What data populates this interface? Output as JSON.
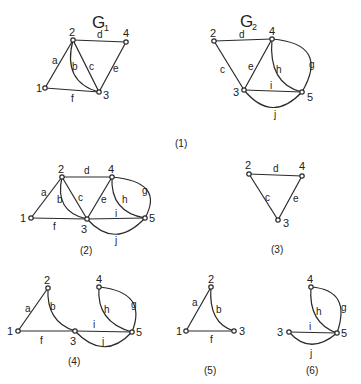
{
  "figure": {
    "caption_1": "(1)",
    "colors": {
      "ink": "#2a2a2a",
      "background": "#ffffff"
    },
    "graphs": {
      "G1": {
        "title": "G",
        "subscript": "1",
        "nodes": {
          "n1": "1",
          "n2": "2",
          "n3": "3",
          "n4": "4"
        },
        "edges": {
          "a": "a",
          "b": "b",
          "c": "c",
          "d": "d",
          "e": "e",
          "f": "f"
        }
      },
      "G2": {
        "title": "G",
        "subscript": "2",
        "nodes": {
          "n2": "2",
          "n3": "3",
          "n4": "4",
          "n5": "5"
        },
        "edges": {
          "c": "c",
          "d": "d",
          "e": "e",
          "g": "g",
          "h": "h",
          "i": "i",
          "j": "j"
        }
      },
      "P2": {
        "caption": "(2)",
        "nodes": {
          "n1": "1",
          "n2": "2",
          "n3": "3",
          "n4": "4",
          "n5": "5"
        },
        "edges": {
          "a": "a",
          "b": "b",
          "c": "c",
          "d": "d",
          "e": "e",
          "f": "f",
          "g": "g",
          "h": "h",
          "i": "i",
          "j": "j"
        }
      },
      "P3": {
        "caption": "(3)",
        "nodes": {
          "n2": "2",
          "n3": "3",
          "n4": "4"
        },
        "edges": {
          "c": "c",
          "d": "d",
          "e": "e"
        }
      },
      "P4": {
        "caption": "(4)",
        "nodes": {
          "n1": "1",
          "n2": "2",
          "n3": "3",
          "n4": "4",
          "n5": "5"
        },
        "edges": {
          "a": "a",
          "b": "b",
          "f": "f",
          "g": "g",
          "h": "h",
          "i": "i",
          "j": "j"
        }
      },
      "P5": {
        "caption": "(5)",
        "nodes": {
          "n1": "1",
          "n2": "2",
          "n3": "3"
        },
        "edges": {
          "a": "a",
          "b": "b",
          "f": "f"
        }
      },
      "P6": {
        "caption": "(6)",
        "nodes": {
          "n3": "3",
          "n4": "4",
          "n5": "5"
        },
        "edges": {
          "g": "g",
          "h": "h",
          "i": "i",
          "j": "j"
        }
      }
    }
  }
}
